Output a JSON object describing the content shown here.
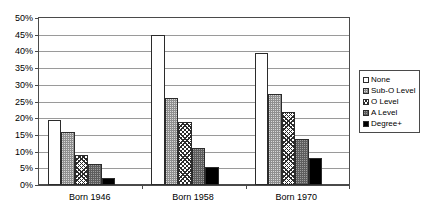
{
  "title_remnant": "",
  "chart_data": {
    "type": "bar",
    "title": "",
    "subtitle": "",
    "xlabel": "",
    "ylabel": "",
    "ylim": [
      0,
      50
    ],
    "y_tick_step": 5,
    "y_tick_labels": [
      "0%",
      "5%",
      "10%",
      "15%",
      "20%",
      "25%",
      "30%",
      "35%",
      "40%",
      "45%",
      "50%"
    ],
    "y_tick_values": [
      0,
      5,
      10,
      15,
      20,
      25,
      30,
      35,
      40,
      45,
      50
    ],
    "grid": true,
    "grid_axis": "y",
    "legend_position": "right",
    "value_unit": "%",
    "categories": [
      "Born 1946",
      "Born 1958",
      "Born 1970"
    ],
    "series": [
      {
        "name": "None",
        "swatch": "#ffffff",
        "pattern": "solid-white",
        "values": [
          19.5,
          44.8,
          39.5
        ]
      },
      {
        "name": "Sub-O Level",
        "swatch": "#8f8f8f",
        "pattern": "gray-stipple",
        "values": [
          16.0,
          26.0,
          27.2
        ]
      },
      {
        "name": "O Level",
        "swatch": "#ffffff",
        "pattern": "crosshatch",
        "values": [
          9.0,
          18.8,
          22.0
        ]
      },
      {
        "name": "A Level",
        "swatch": "#5e5e5e",
        "pattern": "dark-stipple",
        "values": [
          6.3,
          11.0,
          13.8
        ]
      },
      {
        "name": "Degree+",
        "swatch": "#000000",
        "pattern": "solid-black",
        "values": [
          2.2,
          5.4,
          8.2
        ]
      }
    ]
  },
  "legend": {
    "items": [
      {
        "label": "None"
      },
      {
        "label": "Sub-O Level"
      },
      {
        "label": "O Level"
      },
      {
        "label": "A Level"
      },
      {
        "label": "Degree+"
      }
    ]
  },
  "colors": {
    "axis": "#4a4a4a",
    "gridline": "#9a9a9a",
    "bar_outline": "#2b2b2b",
    "background": "#ffffff"
  }
}
